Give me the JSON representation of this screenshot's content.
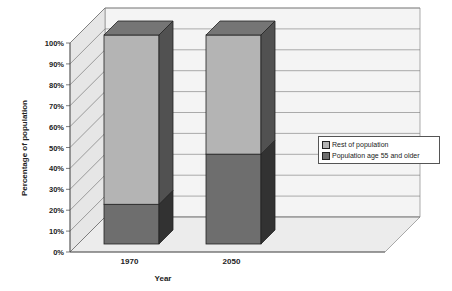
{
  "chart_data": {
    "type": "bar",
    "stacked": true,
    "three_d": true,
    "title": "",
    "xlabel": "Year",
    "ylabel": "Percentage of population",
    "ylim": [
      0,
      100
    ],
    "yticks": [
      "0%",
      "10%",
      "20%",
      "30%",
      "40%",
      "50%",
      "60%",
      "70%",
      "80%",
      "90%",
      "100%"
    ],
    "categories": [
      "1970",
      "2050"
    ],
    "series": [
      {
        "name": "Population age 55 and older",
        "values": [
          19,
          43
        ],
        "color": "#6e6e6e"
      },
      {
        "name": "Rest of population",
        "values": [
          81,
          57
        ],
        "color": "#b4b4b4"
      }
    ],
    "legend": [
      "Rest of population",
      "Population age 55 and older"
    ],
    "legend_position": "right",
    "grid": true
  }
}
